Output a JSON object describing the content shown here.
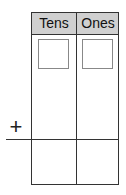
{
  "columns": [
    {
      "label": "Tens"
    },
    {
      "label": "Ones"
    }
  ],
  "operator": "+",
  "colors": {
    "header_bg": "#d0d0d0",
    "line": "#333333",
    "input_box_border": "#888888"
  }
}
